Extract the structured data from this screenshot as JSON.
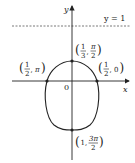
{
  "diagram": {
    "type": "polar-curve-graph",
    "axes": {
      "x_label": "x",
      "y_label": "y",
      "origin_label": "0"
    },
    "asymptote": {
      "label": "y = 1",
      "style": "dashed"
    },
    "points": [
      {
        "id": "left",
        "r_num": "1",
        "r_den": "2",
        "theta": "π"
      },
      {
        "id": "top",
        "r_num": "1",
        "r_den": "3",
        "theta_num": "π",
        "theta_den": "2"
      },
      {
        "id": "right",
        "r_num": "1",
        "r_den": "2",
        "theta": "0"
      },
      {
        "id": "bottom",
        "r": "1",
        "theta_num": "3π",
        "theta_den": "2"
      }
    ]
  }
}
